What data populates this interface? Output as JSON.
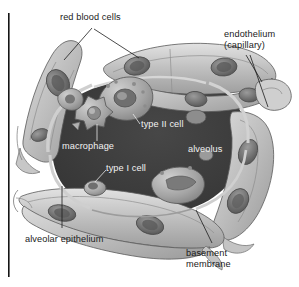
{
  "figure": {
    "style": "grayscale cutaway illustration",
    "background_color": "#ffffff",
    "rule_color": "#151515",
    "label_color_dark": "#1a1a1a",
    "label_color_light": "#f2f2f2",
    "alveolus_fill": "#3c3c3c",
    "tissue_fill": "#b9b9b9",
    "tissue_light": "#d8d8d8",
    "cell_fill": "#8f8f8f",
    "outline_color": "#4a4a4a"
  },
  "labels": {
    "red_blood_cells": "red blood cells",
    "endothelium_line1": "endothelium",
    "endothelium_line2": "(capillary)",
    "type_ii_cell": "type II cell",
    "macrophage": "macrophage",
    "alveolus": "alveolus",
    "type_i_cell": "type I cell",
    "alveolar_epithelium": "alveolar epithelium",
    "basement_membrane_line1": "basement",
    "basement_membrane_line2": "membrane"
  },
  "structures": [
    {
      "name": "alveolus",
      "description": "large dark central air space"
    },
    {
      "name": "type-ii-cell",
      "description": "rounded surfactant-secreting cell at top of alveolar wall"
    },
    {
      "name": "macrophage",
      "description": "star-shaped amoeboid cell on alveolar surface"
    },
    {
      "name": "type-i-cell",
      "description": "flat squamous cell with small oval nucleus"
    },
    {
      "name": "capillary-top",
      "description": "horizontal capillary across upper right"
    },
    {
      "name": "capillary-bottom",
      "description": "horizontal capillary across lower left"
    },
    {
      "name": "capillary-left",
      "description": "diagonal capillary on upper left"
    },
    {
      "name": "capillary-right",
      "description": "diagonal capillary descending on right"
    },
    {
      "name": "red-blood-cell",
      "description": "biconcave disc inside capillary lumen"
    },
    {
      "name": "basement-membrane",
      "description": "thin layer between epithelium and endothelium"
    },
    {
      "name": "alveolar-epithelium",
      "description": "lining layer of the alveolar wall"
    }
  ]
}
